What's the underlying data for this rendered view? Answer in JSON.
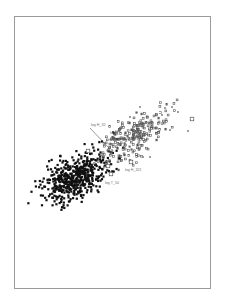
{
  "chart_data": {
    "type": "scatter",
    "title": "",
    "xlabel": "",
    "ylabel": "",
    "grid": false,
    "axes_visible": false,
    "frame": true,
    "legend": null,
    "series": [
      {
        "name": "cluster-dense",
        "marker": "filled-square",
        "color": "#111111",
        "count": 520,
        "center": [
          76,
          177
        ],
        "spread": [
          18,
          10
        ],
        "rotation_deg": -35,
        "seed": 7
      },
      {
        "name": "cluster-upper",
        "marker": "small-square",
        "color": "#555555",
        "count": 230,
        "center": [
          135,
          135
        ],
        "spread": [
          20,
          9
        ],
        "rotation_deg": -35,
        "seed": 19
      },
      {
        "name": "outliers-cross",
        "marker": "cross",
        "color": "#777777",
        "points": [
          [
            140,
            107
          ],
          [
            165,
            108
          ],
          [
            172,
            107
          ],
          [
            178,
            112
          ],
          [
            188,
            131
          ],
          [
            150,
            157
          ],
          [
            143,
            157
          ],
          [
            162,
            115
          ],
          [
            170,
            130
          ],
          [
            130,
            117
          ]
        ]
      },
      {
        "name": "open-squares",
        "marker": "open-square",
        "color": "#444444",
        "points": [
          [
            192,
            119
          ],
          [
            88,
            151
          ],
          [
            131,
            162
          ],
          [
            108,
            166
          ],
          [
            111,
            174
          ]
        ]
      }
    ],
    "annotations": [
      {
        "text": "log H_32",
        "x": 91,
        "y": 126,
        "arrow_to": [
          108,
          147
        ]
      },
      {
        "text": "log S_",
        "x": 110,
        "y": 134
      },
      {
        "text": "log H_321",
        "x": 125,
        "y": 171
      },
      {
        "text": "log T_50",
        "x": 105,
        "y": 184
      }
    ]
  }
}
